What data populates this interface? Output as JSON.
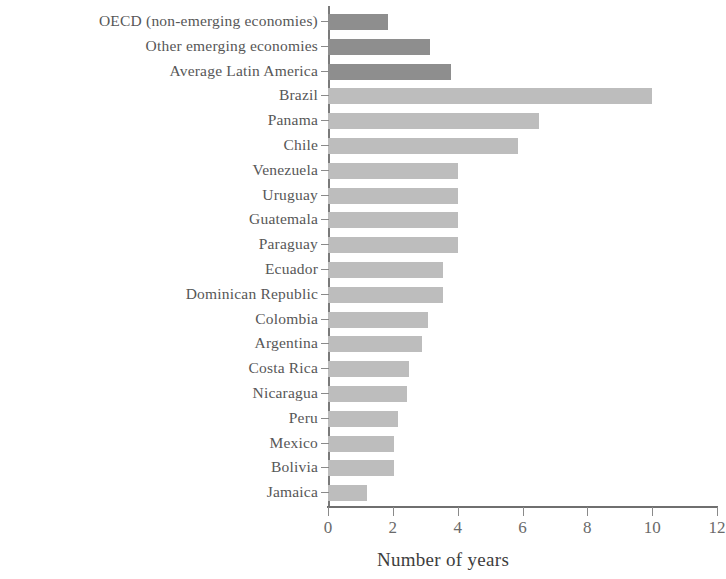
{
  "chart_data": {
    "type": "bar",
    "orientation": "horizontal",
    "title": "",
    "subtitle": "",
    "xlabel": "Number of years",
    "ylabel": "",
    "xlim": [
      0,
      12
    ],
    "xticks": [
      0,
      2,
      4,
      6,
      8,
      10,
      12
    ],
    "xtick_labels": [
      "0",
      "2",
      "4",
      "6",
      "8",
      "10",
      "12"
    ],
    "grid": false,
    "legend": false,
    "legend_position": "none",
    "categories": [
      "OECD (non-emerging economies)",
      "Other emerging economies",
      "Average Latin America",
      "Brazil",
      "Panama",
      "Chile",
      "Venezuela",
      "Uruguay",
      "Guatemala",
      "Paraguay",
      "Ecuador",
      "Dominican Republic",
      "Colombia",
      "Argentina",
      "Costa Rica",
      "Nicaragua",
      "Peru",
      "Mexico",
      "Bolivia",
      "Jamaica"
    ],
    "values": [
      1.85,
      3.15,
      3.8,
      10.0,
      6.5,
      5.85,
      4.0,
      4.0,
      4.0,
      4.0,
      3.55,
      3.55,
      3.1,
      2.9,
      2.5,
      2.45,
      2.15,
      2.05,
      2.05,
      1.2
    ],
    "bar_groups": [
      "benchmark",
      "benchmark",
      "benchmark",
      "country",
      "country",
      "country",
      "country",
      "country",
      "country",
      "country",
      "country",
      "country",
      "country",
      "country",
      "country",
      "country",
      "country",
      "country",
      "country",
      "country"
    ],
    "colors": {
      "benchmark": "#8e8e8e",
      "country": "#bdbdbd",
      "axis": "#7a7a7a",
      "text": "#585858",
      "title_text": "#3d3d3d",
      "background": "#ffffff"
    }
  }
}
